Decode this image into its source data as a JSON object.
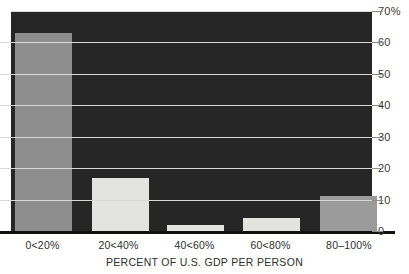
{
  "chart_data": {
    "type": "bar",
    "title": "",
    "xlabel": "PERCENT OF U.S. GDP PER PERSON",
    "ylabel": "",
    "categories": [
      "0<20%",
      "20<40%",
      "40<60%",
      "60<80%",
      "80–100%"
    ],
    "values": [
      63,
      17,
      2,
      4,
      11
    ],
    "ylim": [
      0,
      70
    ],
    "yticks": [
      0,
      10,
      20,
      30,
      40,
      50,
      60,
      70
    ],
    "ytick_labels": [
      "0",
      "10",
      "20",
      "30",
      "40",
      "50",
      "60",
      "70%"
    ],
    "grid": true,
    "legend": null,
    "colors": {
      "plot_background": "#262626",
      "gridline": "#d8d8d4",
      "axis_line": "#14120f",
      "bar_dark": "#8e8e8e",
      "bar_light": "#e3e3e0",
      "text": "#2e2e2c",
      "page_background": "#ffffff"
    },
    "bar_colors": [
      "#8e8e8e",
      "#e3e3e0",
      "#e3e3e0",
      "#e3e3e0",
      "#9b9b9b"
    ]
  }
}
